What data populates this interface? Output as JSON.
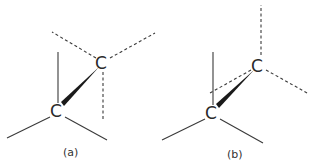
{
  "figure": {
    "panels": [
      {
        "label": "(a)",
        "atoms": [
          {
            "symbol": "C",
            "position": "upper"
          },
          {
            "symbol": "C",
            "position": "lower"
          }
        ],
        "conformation": "eclipsed-like projection"
      },
      {
        "label": "(b)",
        "atoms": [
          {
            "symbol": "C",
            "position": "upper"
          },
          {
            "symbol": "C",
            "position": "lower"
          }
        ],
        "conformation": "staggered-like projection"
      }
    ]
  }
}
